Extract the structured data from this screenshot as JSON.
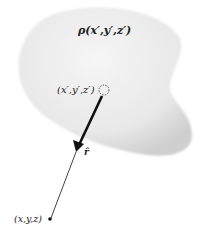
{
  "diagram": {
    "charge_density_label": "ρ(x′,y′,z′)",
    "source_point_label": "(x′,y′,z′)",
    "unit_vector_label": "r̂",
    "field_point_label": "(x,y,z)",
    "colors": {
      "blob_fill": "#e6e6e6",
      "blob_edge": "#c8c8c8",
      "line": "#111111"
    }
  }
}
